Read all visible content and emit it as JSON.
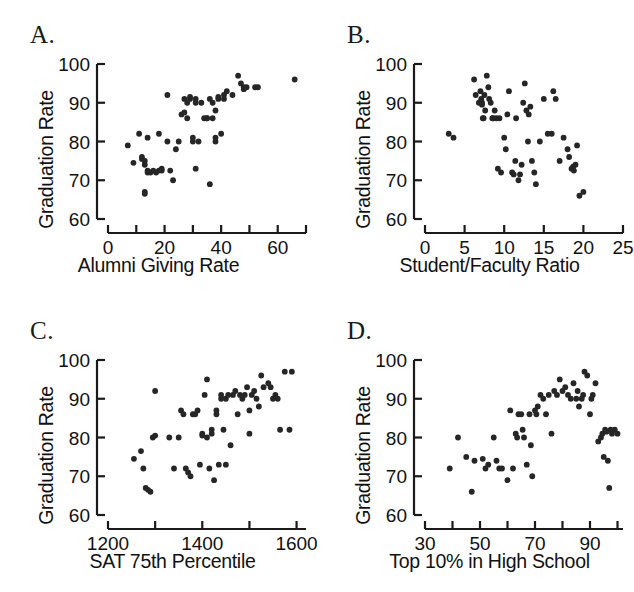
{
  "figure": {
    "panel_count": 4,
    "background_color": "#ffffff",
    "point_color": "#262626",
    "axis_color": "#1a1a1a"
  },
  "panels": [
    {
      "label": "A.",
      "name": "panel-a-alumni-giving",
      "xlabel": "Alumni Giving Rate",
      "ylabel": "Graduation Rate"
    },
    {
      "label": "B.",
      "name": "panel-b-student-faculty",
      "xlabel": "Student/Faculty Ratio",
      "ylabel": "Graduation Rate"
    },
    {
      "label": "C.",
      "name": "panel-c-sat",
      "xlabel": "SAT 75th Percentile",
      "ylabel": "Graduation Rate"
    },
    {
      "label": "D.",
      "name": "panel-d-top10",
      "xlabel": "Top 10% in High School",
      "ylabel": "Graduation Rate"
    }
  ],
  "chart_data": [
    {
      "type": "scatter",
      "panel": "A",
      "title": "A.",
      "xlabel": "Alumni Giving Rate",
      "ylabel": "Graduation Rate",
      "xlim": [
        0,
        70
      ],
      "ylim": [
        60,
        100
      ],
      "xticks": [
        0,
        10,
        20,
        30,
        40,
        50,
        60,
        70
      ],
      "xtick_labels": [
        "0",
        "",
        "20",
        "",
        "40",
        "",
        "60",
        ""
      ],
      "yticks": [
        60,
        70,
        80,
        90,
        100
      ],
      "ytick_labels": [
        "60",
        "70",
        "80",
        "90",
        "100"
      ],
      "grid": false,
      "legend": false,
      "x": [
        7,
        9,
        11,
        12,
        12,
        13,
        13,
        13,
        13,
        14,
        14,
        14,
        15,
        16,
        17,
        18,
        18,
        19,
        19,
        21,
        21,
        22,
        23,
        24,
        25,
        26,
        27,
        27,
        28,
        28,
        29,
        29,
        30,
        30,
        31,
        31,
        31,
        32,
        33,
        34,
        35,
        35,
        36,
        36,
        37,
        37,
        38,
        38,
        38,
        39,
        39,
        40,
        41,
        41,
        42,
        44,
        46,
        47,
        48,
        48,
        49,
        52,
        53,
        66
      ],
      "y": [
        79,
        74.5,
        82,
        76,
        75.5,
        75,
        74,
        67,
        66.5,
        81,
        72,
        72.5,
        72,
        72.5,
        72,
        82,
        72.5,
        73,
        72.5,
        92,
        80,
        72.5,
        70,
        78,
        80,
        87,
        87.5,
        91,
        86,
        90,
        91,
        91.5,
        80,
        81,
        91,
        90,
        73,
        80,
        90,
        86,
        86,
        86,
        91,
        69,
        86,
        90,
        88,
        81,
        80,
        91,
        91.5,
        82,
        91,
        92,
        93,
        92,
        97,
        95,
        94,
        93.5,
        94,
        94,
        94,
        96
      ]
    },
    {
      "type": "scatter",
      "panel": "B",
      "title": "B.",
      "xlabel": "Student/Faculty Ratio",
      "ylabel": "Graduation Rate",
      "xlim": [
        0,
        25
      ],
      "ylim": [
        60,
        100
      ],
      "xticks": [
        0,
        5,
        10,
        15,
        20,
        25
      ],
      "xtick_labels": [
        "0",
        "5",
        "10",
        "15",
        "20",
        "25"
      ],
      "yticks": [
        60,
        70,
        80,
        90,
        100
      ],
      "ytick_labels": [
        "60",
        "70",
        "80",
        "90",
        "100"
      ],
      "grid": false,
      "legend": false,
      "x": [
        3,
        3.6,
        6.2,
        6.4,
        6.8,
        7,
        7.1,
        7.1,
        7.2,
        7.2,
        7.3,
        7.4,
        7.5,
        7.6,
        7.8,
        8,
        8.1,
        8.3,
        8.5,
        8.6,
        8.8,
        9,
        9.2,
        9.4,
        9.6,
        10,
        10.2,
        10.4,
        10.6,
        11,
        11.2,
        11.4,
        11.5,
        11.8,
        12,
        12.2,
        12.4,
        12.6,
        12.8,
        13,
        13.1,
        13.3,
        13.5,
        13.8,
        14,
        14.5,
        15,
        15.5,
        16,
        16.2,
        16.5,
        17,
        17.5,
        18,
        18.2,
        18.5,
        18.7,
        18.8,
        19,
        19.2,
        19.5,
        20
      ],
      "y": [
        82,
        81,
        96,
        92,
        90,
        93,
        91,
        90.5,
        90,
        89.5,
        86,
        86,
        92,
        88,
        97,
        94,
        91,
        90,
        86,
        86,
        88,
        86,
        73,
        86,
        72,
        81,
        78,
        87,
        93,
        72,
        71.5,
        75,
        86,
        70,
        71.5,
        74,
        90,
        95,
        88,
        80,
        87,
        89,
        75,
        72,
        69,
        80,
        91,
        82,
        82,
        93,
        91,
        75,
        81,
        78,
        76,
        73,
        73.5,
        72.5,
        74,
        79,
        66,
        67
      ]
    },
    {
      "type": "scatter",
      "panel": "C",
      "title": "C.",
      "xlabel": "SAT 75th Percentile",
      "ylabel": "Graduation Rate",
      "xlim": [
        1200,
        1620
      ],
      "ylim": [
        60,
        100
      ],
      "xticks": [
        1200,
        1300,
        1400,
        1500,
        1600
      ],
      "xtick_labels": [
        "1200",
        "",
        "1400",
        "",
        "1600"
      ],
      "yticks": [
        60,
        70,
        80,
        90,
        100
      ],
      "ytick_labels": [
        "60",
        "70",
        "80",
        "90",
        "100"
      ],
      "grid": false,
      "legend": false,
      "x": [
        1255,
        1270,
        1275,
        1280,
        1285,
        1290,
        1295,
        1300,
        1300,
        1330,
        1340,
        1350,
        1355,
        1360,
        1365,
        1370,
        1375,
        1380,
        1385,
        1390,
        1395,
        1400,
        1400,
        1405,
        1410,
        1410,
        1415,
        1420,
        1420,
        1425,
        1430,
        1430,
        1435,
        1440,
        1440,
        1445,
        1450,
        1450,
        1455,
        1460,
        1465,
        1470,
        1475,
        1480,
        1485,
        1490,
        1495,
        1500,
        1500,
        1505,
        1510,
        1515,
        1520,
        1525,
        1530,
        1540,
        1545,
        1550,
        1555,
        1560,
        1565,
        1575,
        1585,
        1590
      ],
      "y": [
        74.5,
        76.5,
        72,
        67,
        66.5,
        66,
        80,
        92,
        80.5,
        80,
        72,
        80,
        87,
        86,
        72,
        71,
        70,
        86,
        86,
        87,
        73,
        80.5,
        81,
        91,
        95,
        80,
        72,
        81,
        82,
        69,
        87,
        86,
        73,
        90,
        91,
        82,
        90,
        73,
        91,
        78,
        91,
        92,
        86,
        91,
        90,
        91,
        93,
        81,
        87,
        91,
        92,
        90,
        88,
        96,
        93,
        94,
        93,
        90,
        91,
        90,
        82,
        97,
        82,
        97
      ]
    },
    {
      "type": "scatter",
      "panel": "D",
      "title": "D.",
      "xlabel": "Top 10% in High School",
      "ylabel": "Graduation Rate",
      "xlim": [
        30,
        102
      ],
      "ylim": [
        60,
        100
      ],
      "xticks": [
        30,
        40,
        50,
        60,
        70,
        80,
        90,
        100
      ],
      "xtick_labels": [
        "30",
        "",
        "50",
        "",
        "70",
        "",
        "90",
        ""
      ],
      "yticks": [
        60,
        70,
        80,
        90,
        100
      ],
      "ytick_labels": [
        "60",
        "70",
        "80",
        "90",
        "100"
      ],
      "grid": false,
      "legend": false,
      "x": [
        39,
        42,
        45,
        47,
        48,
        51,
        52,
        53,
        55,
        56,
        57,
        58,
        60,
        61,
        62,
        63,
        63.5,
        64,
        65,
        65.5,
        66,
        67,
        68,
        68.5,
        69,
        70,
        70.5,
        71,
        72,
        73,
        74,
        75,
        76,
        77,
        78,
        79,
        80,
        81,
        82,
        83,
        84,
        85,
        85.5,
        86,
        87,
        87.5,
        88,
        89,
        90,
        90.5,
        91,
        92,
        93,
        94,
        94.5,
        95,
        95.5,
        96,
        96.5,
        97,
        97.5,
        98,
        99,
        100
      ],
      "y": [
        72,
        80,
        75,
        66,
        74,
        74.5,
        72,
        73,
        80,
        74,
        72,
        72,
        69,
        87,
        72,
        81,
        80,
        86,
        86,
        82,
        80,
        73,
        86,
        78,
        70,
        87,
        86,
        88,
        91,
        90,
        86,
        91,
        81,
        92,
        91,
        95,
        92,
        93,
        91,
        90,
        94,
        90,
        92,
        88,
        90,
        91,
        97,
        96,
        86,
        90,
        91,
        94,
        79,
        80,
        81,
        75,
        82,
        81.5,
        74,
        67,
        82,
        81,
        82,
        81
      ]
    }
  ]
}
